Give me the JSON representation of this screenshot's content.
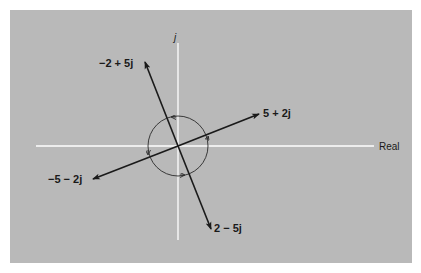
{
  "diagram": {
    "axes": {
      "horizontal_label": "Real",
      "vertical_label": "j"
    },
    "vectors": [
      {
        "label": "5 + 2j",
        "re": 5,
        "im": 2
      },
      {
        "label": "−2 + 5j",
        "re": -2,
        "im": 5
      },
      {
        "label": "−5 − 2j",
        "re": -5,
        "im": -2
      },
      {
        "label": "2 − 5j",
        "re": 2,
        "im": -5
      }
    ],
    "rotation_circle": {
      "direction": "counterclockwise",
      "arrow_count": 4
    },
    "colors": {
      "background": "#b9b9b9",
      "axes": "#ffffff",
      "vectors": "#1a1a1a",
      "circle": "#2a2a2a"
    }
  },
  "labels": {
    "v1": "5 + 2j",
    "v2": "−2 + 5j",
    "v3": "−5 − 2j",
    "v4": "2 − 5j",
    "real": "Real",
    "imag": "j"
  }
}
